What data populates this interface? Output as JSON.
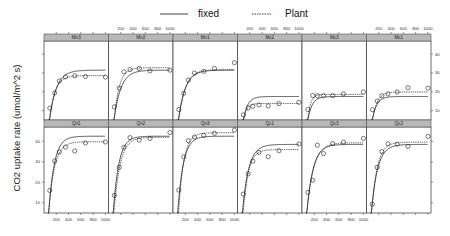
{
  "chart_data": {
    "type": "line",
    "title": "",
    "xlabel": "",
    "ylabel": "CO2 uptake rate (umol/m^2 s)",
    "legend": {
      "position": "top",
      "entries": [
        {
          "label": "fixed",
          "style": "solid"
        },
        {
          "label": "Plant",
          "style": "dashed"
        }
      ]
    },
    "xlim": [
      0,
      1050
    ],
    "ylim": [
      5,
      47
    ],
    "x_ticks": [
      200,
      400,
      600,
      800,
      1000
    ],
    "x_tick_labels": [
      "200",
      "400",
      "600",
      "800",
      "1000"
    ],
    "y_ticks": [
      10,
      20,
      30,
      40
    ],
    "y_tick_labels": [
      "10",
      "20",
      "30",
      "40"
    ],
    "grid": false,
    "layout": {
      "rows": 2,
      "cols": 6
    },
    "x": [
      95,
      175,
      250,
      350,
      500,
      675,
      1000
    ],
    "panels": [
      {
        "name": "Mn3",
        "row": 0,
        "col": 0,
        "points": [
          11.3,
          19.4,
          25.8,
          27.9,
          28.5,
          28.1,
          27.8
        ],
        "fixed": {
          "asym": 31.5,
          "rate": 0.009,
          "x0": 70
        },
        "plant": {
          "asym": 28.6,
          "rate": 0.011,
          "x0": 72
        }
      },
      {
        "name": "Mn2",
        "row": 0,
        "col": 1,
        "points": [
          12.0,
          22.0,
          30.6,
          31.8,
          32.4,
          31.1,
          31.5
        ],
        "fixed": {
          "asym": 31.5,
          "rate": 0.009,
          "x0": 70
        },
        "plant": {
          "asym": 32.8,
          "rate": 0.012,
          "x0": 78
        }
      },
      {
        "name": "Mn1",
        "row": 0,
        "col": 2,
        "points": [
          10.6,
          19.2,
          26.2,
          30.0,
          30.9,
          32.4,
          35.5
        ],
        "fixed": {
          "asym": 31.5,
          "rate": 0.009,
          "x0": 70
        },
        "plant": {
          "asym": 31.8,
          "rate": 0.009,
          "x0": 72
        }
      },
      {
        "name": "Mc2",
        "row": 0,
        "col": 3,
        "points": [
          7.7,
          11.4,
          12.3,
          13.0,
          12.5,
          13.7,
          14.4
        ],
        "fixed": {
          "asym": 17.5,
          "rate": 0.014,
          "x0": 70
        },
        "plant": {
          "asym": 13.8,
          "rate": 0.02,
          "x0": 80
        }
      },
      {
        "name": "Mc3",
        "row": 0,
        "col": 4,
        "points": [
          10.6,
          18.0,
          17.9,
          17.9,
          17.9,
          18.9,
          19.9
        ],
        "fixed": {
          "asym": 17.5,
          "rate": 0.014,
          "x0": 70
        },
        "plant": {
          "asym": 18.6,
          "rate": 0.022,
          "x0": 80
        }
      },
      {
        "name": "Mc1",
        "row": 0,
        "col": 5,
        "points": [
          10.5,
          15.1,
          17.9,
          18.9,
          19.9,
          22.2,
          21.9
        ],
        "fixed": {
          "asym": 17.5,
          "rate": 0.014,
          "x0": 70
        },
        "plant": {
          "asym": 19.9,
          "rate": 0.013,
          "x0": 75
        }
      },
      {
        "name": "Qn1",
        "row": 1,
        "col": 0,
        "points": [
          16.0,
          30.4,
          34.8,
          37.2,
          35.3,
          39.2,
          39.7
        ],
        "fixed": {
          "asym": 42.5,
          "rate": 0.011,
          "x0": 65
        },
        "plant": {
          "asym": 39.8,
          "rate": 0.0105,
          "x0": 62
        }
      },
      {
        "name": "Qn2",
        "row": 1,
        "col": 1,
        "points": [
          13.6,
          27.3,
          37.1,
          41.8,
          40.6,
          41.4,
          44.3
        ],
        "fixed": {
          "asym": 42.5,
          "rate": 0.011,
          "x0": 65
        },
        "plant": {
          "asym": 42.0,
          "rate": 0.01,
          "x0": 75
        }
      },
      {
        "name": "Qn3",
        "row": 1,
        "col": 2,
        "points": [
          16.2,
          32.4,
          40.3,
          42.1,
          42.9,
          43.9,
          45.5
        ],
        "fixed": {
          "asym": 42.5,
          "rate": 0.011,
          "x0": 65
        },
        "plant": {
          "asym": 44.2,
          "rate": 0.012,
          "x0": 80
        }
      },
      {
        "name": "Qc1",
        "row": 1,
        "col": 3,
        "points": [
          14.2,
          24.1,
          30.3,
          34.6,
          32.5,
          35.4,
          38.7
        ],
        "fixed": {
          "asym": 38.5,
          "rate": 0.01,
          "x0": 65
        },
        "plant": {
          "asym": 36.0,
          "rate": 0.012,
          "x0": 80
        }
      },
      {
        "name": "Qc3",
        "row": 1,
        "col": 4,
        "points": [
          15.1,
          21.0,
          38.1,
          34.0,
          38.9,
          39.6,
          41.4
        ],
        "fixed": {
          "asym": 38.5,
          "rate": 0.01,
          "x0": 65
        },
        "plant": {
          "asym": 39.3,
          "rate": 0.009,
          "x0": 62
        }
      },
      {
        "name": "Qc2",
        "row": 1,
        "col": 5,
        "points": [
          9.3,
          27.3,
          35.0,
          38.8,
          38.6,
          37.5,
          42.4
        ],
        "fixed": {
          "asym": 38.5,
          "rate": 0.01,
          "x0": 65
        },
        "plant": {
          "asym": 39.6,
          "rate": 0.011,
          "x0": 70
        }
      }
    ]
  },
  "colors": {
    "strip": "#b8b8b8",
    "strip_border": "#555555",
    "panel_border": "#333333",
    "line": "#111111",
    "point": "#222222"
  }
}
